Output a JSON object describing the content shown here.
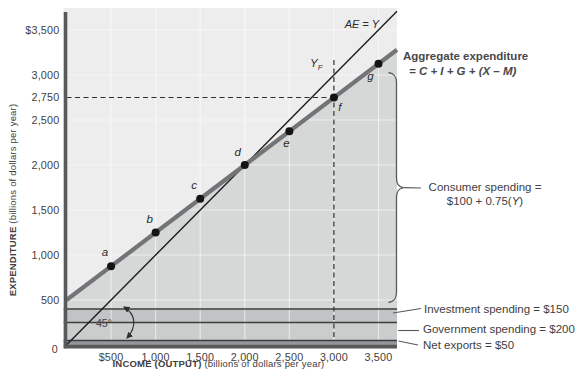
{
  "figure_name": "Keynesian cross: aggregate expenditure diagram",
  "labels": {
    "y_title_bold": "EXPENDITURE",
    "y_title_rest": " (billions of dollars per year)",
    "x_title_bold": "INCOME (OUTPUT)",
    "x_title_rest": " (billions of dollars per year)",
    "ae_equals_y": "AE = Y",
    "yf_main": "Y",
    "yf_sub": "F",
    "agg_line1": "Aggregate expenditure",
    "agg_line2": "= C + I + G + (X – M)",
    "consumer_line1": "Consumer spending =",
    "consumer_line2_pre": "$100 + 0.75(",
    "consumer_line2_it": "Y",
    "consumer_line2_post": ")",
    "investment": "Investment spending = $150",
    "government": "Government spending = $200",
    "net_exports": "Net exports = $50",
    "angle_45": "45°"
  },
  "chart_data": {
    "type": "line",
    "title": "",
    "xlabel": "INCOME (OUTPUT) (billions of dollars per year)",
    "ylabel": "EXPENDITURE (billions of dollars per year)",
    "xlim": [
      0,
      3700
    ],
    "ylim": [
      0,
      3745
    ],
    "grid": true,
    "x_ticks": [
      {
        "label": "$500",
        "value": 500
      },
      {
        "label": "1,000",
        "value": 1000
      },
      {
        "label": "1,500",
        "value": 1500
      },
      {
        "label": "2,000",
        "value": 2000
      },
      {
        "label": "2,500",
        "value": 2500
      },
      {
        "label": "3,000",
        "value": 3000
      },
      {
        "label": "3,500",
        "value": 3500
      }
    ],
    "y_ticks": [
      {
        "label": "$3,500",
        "value": 3500
      },
      {
        "label": "3,000",
        "value": 3000
      },
      {
        "label": "2,750",
        "value": 2750
      },
      {
        "label": "2,500",
        "value": 2500
      },
      {
        "label": "2,000",
        "value": 2000
      },
      {
        "label": "1,500",
        "value": 1500
      },
      {
        "label": "1,000",
        "value": 1000
      },
      {
        "label": "500",
        "value": 500
      },
      {
        "label": "0",
        "value": 0
      }
    ],
    "grid_values": [
      500,
      1000,
      1500,
      2000,
      2500,
      3000,
      3500
    ],
    "series": [
      {
        "name": "45-degree line",
        "equation": "AE = Y",
        "intercept": 0,
        "slope": 1
      },
      {
        "name": "Aggregate expenditure",
        "equation": "AE = C + I + G + (X − M) = 500 + 0.75Y",
        "intercept": 500,
        "slope": 0.75
      }
    ],
    "points": [
      {
        "label": "a",
        "x": 500,
        "y": 875
      },
      {
        "label": "b",
        "x": 1000,
        "y": 1250
      },
      {
        "label": "c",
        "x": 1500,
        "y": 1625
      },
      {
        "label": "d",
        "x": 2000,
        "y": 2000
      },
      {
        "label": "e",
        "x": 2500,
        "y": 2375
      },
      {
        "label": "f",
        "x": 3000,
        "y": 2750
      },
      {
        "label": "g",
        "x": 3500,
        "y": 3125
      }
    ],
    "equilibrium_point": {
      "label": "d",
      "x": 2000,
      "y": 2000
    },
    "full_employment_output": 3000,
    "dashed_guides": {
      "horizontal_at_y": 2750,
      "vertical_at_x": 3000
    },
    "components": {
      "consumer_spending": "$100 + 0.75(Y)",
      "investment_spending": 150,
      "government_spending": 200,
      "net_exports": 50,
      "bands": [
        {
          "name": "Net exports",
          "from": 0,
          "to": 50,
          "color_key": "net_exports_band"
        },
        {
          "name": "Government spending",
          "from": 50,
          "to": 250,
          "color_key": "government_band"
        },
        {
          "name": "Investment spending",
          "from": 250,
          "to": 400,
          "color_key": "investment_band"
        }
      ]
    }
  },
  "colors": {
    "plot_bg": "#ededee",
    "consumer_area": "#d6d7d7",
    "investment_band": "#c2c3c4",
    "government_band": "#cbcccc",
    "net_exports_band": "#95969a",
    "ae_line": "#737477",
    "line_45": "#1c1c1c",
    "axis": "#58595b",
    "band_line": "#3d3e40",
    "dash_line": "#2e2e2e",
    "grid_line": "#ffffff",
    "point": "#141414",
    "text": "#414042"
  }
}
